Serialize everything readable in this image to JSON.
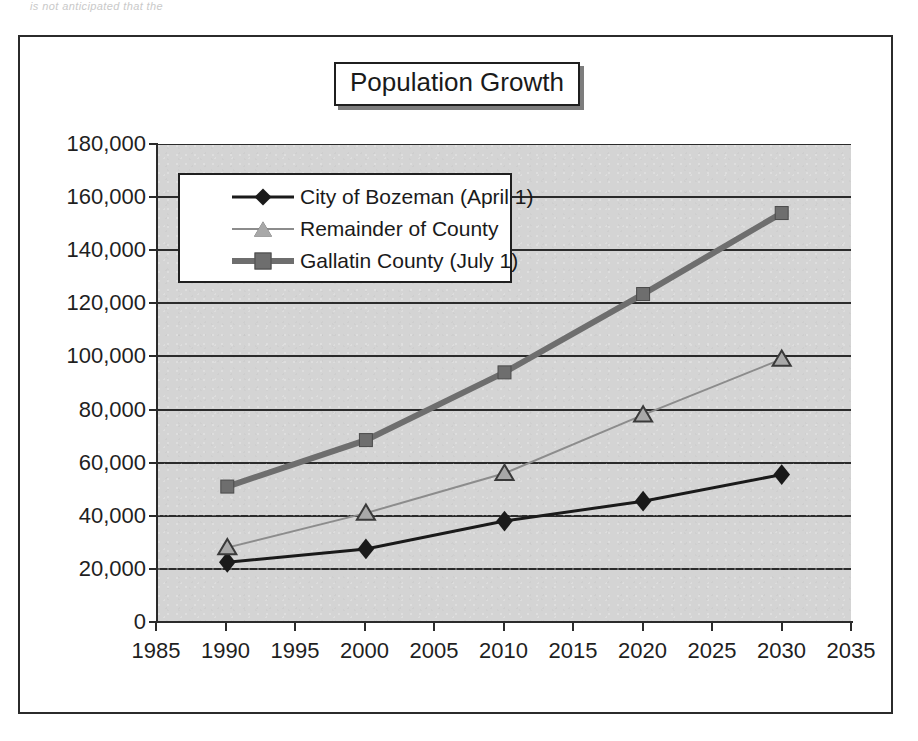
{
  "page": {
    "scan_fragment": "is not anticipated that the"
  },
  "chart": {
    "title": "Population Growth",
    "legend": {
      "position": "inside-top-left",
      "entries": [
        {
          "label": "City of Bozeman (April 1)",
          "marker": "diamond",
          "color": "#1a1a1a",
          "line_width": 3
        },
        {
          "label": "Remainder of County",
          "marker": "triangle",
          "color": "#8c8c8c",
          "line_width": 2
        },
        {
          "label": "Gallatin County (July 1)",
          "marker": "square",
          "color": "#6e6e6e",
          "line_width": 6
        }
      ]
    }
  },
  "chart_data": {
    "type": "line",
    "title": "Population Growth",
    "xlabel": "",
    "ylabel": "",
    "x": [
      1990,
      2000,
      2010,
      2020,
      2030
    ],
    "xlim": [
      1985,
      2035
    ],
    "ylim": [
      0,
      180000
    ],
    "xticks": [
      1985,
      1990,
      1995,
      2000,
      2005,
      2010,
      2015,
      2020,
      2025,
      2030,
      2035
    ],
    "xtick_labels": [
      "1985",
      "1990",
      "1995",
      "2000",
      "2005",
      "2010",
      "2015",
      "2020",
      "2025",
      "2030",
      "2035"
    ],
    "yticks": [
      0,
      20000,
      40000,
      60000,
      80000,
      100000,
      120000,
      140000,
      160000,
      180000
    ],
    "ytick_labels": [
      "0",
      "20,000",
      "40,000",
      "60,000",
      "80,000",
      "100,000",
      "120,000",
      "140,000",
      "160,000",
      "180,000"
    ],
    "grid": "horizontal",
    "plot_bgcolor": "#d4d4d4",
    "series": [
      {
        "name": "City of Bozeman (April 1)",
        "marker": "diamond",
        "color": "#1a1a1a",
        "line_width": 3,
        "values": [
          22500,
          27500,
          38000,
          45500,
          55500
        ]
      },
      {
        "name": "Remainder of County",
        "marker": "triangle",
        "color": "#8c8c8c",
        "line_width": 2,
        "values": [
          28000,
          41000,
          56000,
          78000,
          99000
        ]
      },
      {
        "name": "Gallatin County (July 1)",
        "marker": "square",
        "color": "#6e6e6e",
        "line_width": 6,
        "values": [
          51000,
          68500,
          94000,
          123500,
          154000
        ]
      }
    ]
  }
}
